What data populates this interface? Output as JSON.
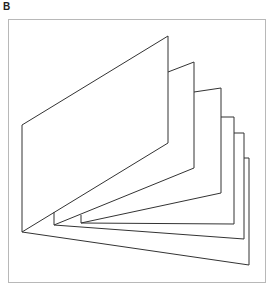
{
  "panel": {
    "label": "B"
  },
  "figure": {
    "frame": {
      "x": 8,
      "y": 19,
      "width": 257,
      "height": 263,
      "stroke": "#b8b8b8"
    },
    "stroke_color": "#333333",
    "spine_point": [
      22,
      232
    ],
    "pages": [
      {
        "name": "page-1",
        "points": "22,232 22,125 168,36 168,143 22,232"
      },
      {
        "name": "page-2",
        "points": "168,72 194,62 194,168 54,225 54,212"
      },
      {
        "name": "page-3",
        "points": "194,92 221,88 221,193 81,223 81,215"
      },
      {
        "name": "page-4",
        "points": "221,117 234,117 234,224 81,223"
      },
      {
        "name": "page-5",
        "points": "234,133 244,133 244,239 54,225"
      },
      {
        "name": "page-6",
        "points": "244,158 249,158 249,265 22,232"
      }
    ]
  }
}
